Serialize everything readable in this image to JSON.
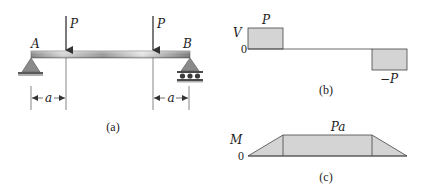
{
  "figure_a": {
    "caption": "(a)",
    "support_left_label": "A",
    "support_right_label": "B",
    "load_left_label": "P",
    "load_right_label": "P",
    "dim_left_label": "a",
    "dim_right_label": "a",
    "support_left_type": "pin",
    "support_right_type": "roller"
  },
  "figure_b": {
    "caption": "(b)",
    "axis_label": "V",
    "zero_label": "0",
    "positive_label": "P",
    "negative_label": "−P"
  },
  "figure_c": {
    "caption": "(c)",
    "axis_label": "M",
    "zero_label": "0",
    "peak_label": "Pa"
  },
  "colors": {
    "fill_gray": "#d4d4d4",
    "line": "#333333",
    "beam_dark": "#7a7a7a",
    "beam_light": "#e8e8e8",
    "support": "#8a8a8a"
  }
}
